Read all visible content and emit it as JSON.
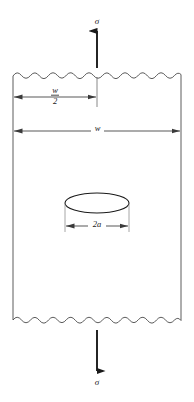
{
  "figure": {
    "type": "engineering-diagram",
    "background_color": "#ffffff",
    "line_color": "#4a4a4a",
    "arrow_color": "#1a1a1a",
    "text_color": "#1a1a1a"
  },
  "labels": {
    "stress_top": "σ",
    "stress_bottom": "σ",
    "width_full": "w",
    "half_width_numerator": "w",
    "half_width_denominator": "2",
    "crack_length": "2a"
  },
  "geometry": {
    "plate": {
      "left_x": 13,
      "right_x": 181,
      "top_y": 75,
      "bottom_y": 320,
      "edge_style": "wavy-torn"
    },
    "wave": {
      "amplitude": 3.5,
      "wavelength": 17
    },
    "crack_ellipse": {
      "center_x": 97,
      "center_y": 203,
      "radius_x": 32,
      "radius_y": 10
    },
    "dimension_half_width": {
      "y": 97,
      "from_x": 13,
      "to_x": 97
    },
    "dimension_full_width": {
      "y": 131,
      "from_x": 13,
      "to_x": 181
    },
    "dimension_crack": {
      "y": 226,
      "from_x": 65,
      "to_x": 129
    },
    "arrow_top": {
      "x": 97,
      "tail_y": 68,
      "head_y": 30
    },
    "arrow_bottom": {
      "x": 97,
      "tail_y": 330,
      "head_y": 372
    }
  }
}
